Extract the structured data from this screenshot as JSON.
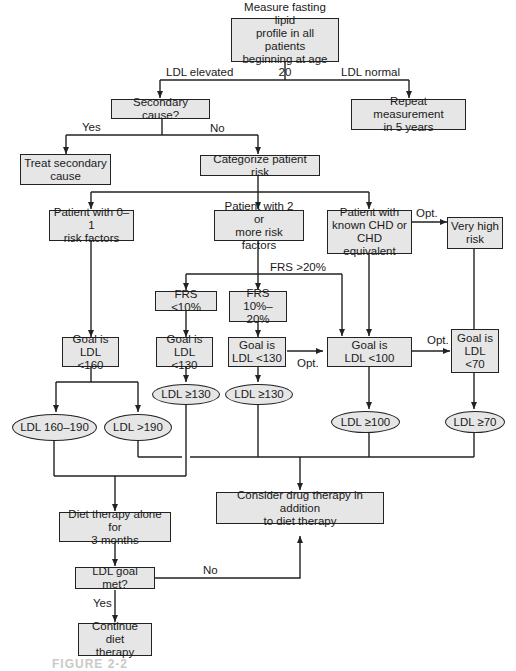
{
  "colors": {
    "box_fill": "#e6e6e6",
    "box_border": "#222222",
    "line": "#222222",
    "caption": "#c9c9c9"
  },
  "nodes": {
    "start": "Measure fasting lipid\nprofile in all patients\nbeginning at age 20",
    "secondary_cause": "Secondary cause?",
    "repeat": "Repeat measurement\nin 5 years",
    "treat_secondary": "Treat  secondary\ncause",
    "categorize": "Categorize patient risk",
    "risk_0_1": "Patient with 0–1\nrisk factors",
    "risk_2plus": "Patient with 2 or\nmore risk factors",
    "known_chd": "Patient with\nknown CHD or\nCHD equivalent",
    "very_high": "Very high\nrisk",
    "frs_lt10": "FRS <10%",
    "frs_10_20": "FRS\n10%–20%",
    "goal_160": "Goal is\nLDL <160",
    "goal_130a": "Goal is\nLDL <130",
    "goal_130b": "Goal is\nLDL <130",
    "goal_100": "Goal is\nLDL <100",
    "goal_70": "Goal is\nLDL\n<70",
    "ldl_130a": "LDL ≥130",
    "ldl_130b": "LDL ≥130",
    "ldl_160_190": "LDL 160–190",
    "ldl_gt190": "LDL >190",
    "ldl_100": "LDL ≥100",
    "ldl_70": "LDL ≥70",
    "drug_therapy": "Consider drug therapy in addition\nto diet therapy",
    "diet_3mo": "Diet therapy alone for\n3 months",
    "goal_met": "LDL goal met?",
    "continue_diet": "Continue diet\ntherapy"
  },
  "edge_labels": {
    "ldl_elevated": "LDL elevated",
    "ldl_normal": "LDL normal",
    "yes1": "Yes",
    "no1": "No",
    "opt_chd": "Opt.",
    "frs_gt20": "FRS >20%",
    "opt_130": "Opt.",
    "opt_100": "Opt.",
    "no2": "No",
    "yes2": "Yes"
  },
  "caption": "FIGURE 2-2"
}
